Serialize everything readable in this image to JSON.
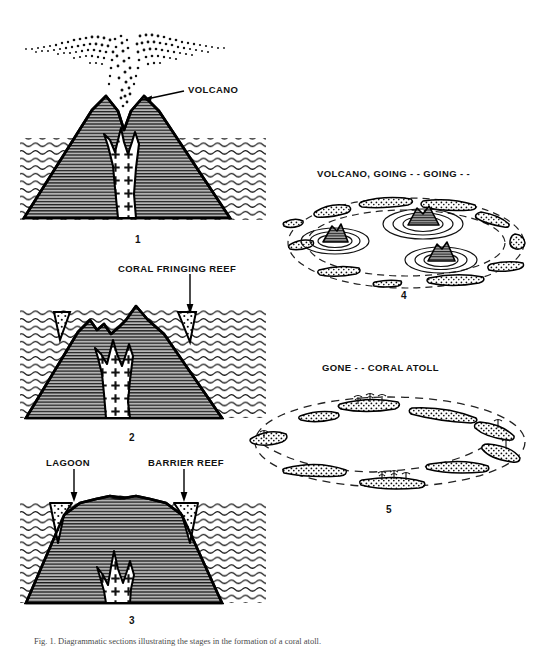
{
  "figure": {
    "domain": "scientific-diagram",
    "caption_prefix": "Fig. 1.",
    "caption_text": "Fig. 1. Diagrammatic sections illustrating the stages in the formation of a coral atoll."
  },
  "panels": [
    {
      "id": "panel-1",
      "number": "1",
      "kind": "cross-section",
      "description": "Active volcanic island erupting above sea level",
      "labels": [
        {
          "name": "volcano",
          "text": "VOLCANO",
          "has_arrow": true,
          "arrow_direction": "left"
        }
      ],
      "features": [
        "ash-plume",
        "sea",
        "volcanic-cone",
        "magma-conduit"
      ]
    },
    {
      "id": "panel-2",
      "number": "2",
      "kind": "cross-section",
      "description": "Subsiding island with coral reef growing along its shore",
      "labels": [
        {
          "name": "coral-fringing-reef",
          "text": "CORAL FRINGING REEF",
          "has_arrow": true,
          "arrow_direction": "down"
        }
      ],
      "features": [
        "sea",
        "eroded-cone",
        "magma-conduit",
        "fringing-reef"
      ]
    },
    {
      "id": "panel-3",
      "number": "3",
      "kind": "cross-section",
      "description": "Further subsidence; reef separated from island by a lagoon",
      "labels": [
        {
          "name": "lagoon",
          "text": "LAGOON",
          "has_arrow": true,
          "arrow_direction": "down"
        },
        {
          "name": "barrier-reef",
          "text": "BARRIER REEF",
          "has_arrow": true,
          "arrow_direction": "down"
        }
      ],
      "features": [
        "sea",
        "low-island",
        "magma-remnant",
        "barrier-reef",
        "lagoon"
      ]
    },
    {
      "id": "panel-4",
      "number": "4",
      "kind": "oblique-view",
      "description": "Oblique view: volcanic peaks nearly submerged inside reef ring",
      "title": "VOLCANO,  GOING - - GOING - -",
      "labels": [],
      "features": [
        "reef-ring",
        "lagoon",
        "volcanic-remnant-islet"
      ],
      "remnant_count": 3
    },
    {
      "id": "panel-5",
      "number": "5",
      "kind": "oblique-view",
      "description": "Oblique view: volcano fully submerged, only the coral atoll ring remains",
      "title": "GONE - -   CORAL ATOLL",
      "labels": [],
      "features": [
        "reef-ring",
        "lagoon",
        "palm-islets"
      ],
      "remnant_count": 0
    }
  ],
  "colors": {
    "ink": "#000000",
    "paper": "#ffffff",
    "rock_fill": "#b0b0b0",
    "rock_hatch": "#1a1a1a",
    "sea_line": "#111111",
    "reef_fill": "#ffffff",
    "caption_text": "#4a4a4a"
  }
}
